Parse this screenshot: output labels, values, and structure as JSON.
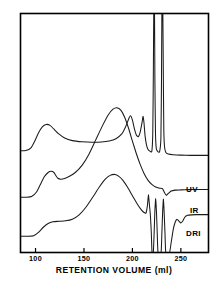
{
  "chart_data": {
    "type": "line",
    "title": "",
    "subtitle": "",
    "xlabel": "RETENTION VOLUME (ml)",
    "ylabel": "",
    "xlim": [
      85,
      278
    ],
    "ylim": [
      0,
      100
    ],
    "grid": false,
    "legend_position": "inline-right",
    "x_ticks": [
      100,
      150,
      200,
      250
    ],
    "x_tick_labels": [
      "100",
      "150",
      "200",
      "250"
    ],
    "y_ticks": [],
    "y_tick_labels": [],
    "annotations": [
      {
        "text": "UV",
        "x": 262,
        "y": 46
      },
      {
        "text": "IR",
        "x": 264,
        "y": 26
      },
      {
        "text": "DRI",
        "x": 262,
        "y": 8
      }
    ],
    "series": [
      {
        "name": "UV",
        "label": "UV",
        "color": "#1a1a1a",
        "points": [
          [
            85,
            42.5
          ],
          [
            90,
            42.6
          ],
          [
            95,
            43.6
          ],
          [
            99,
            46.4
          ],
          [
            103,
            50.0
          ],
          [
            107,
            52.6
          ],
          [
            111,
            53.6
          ],
          [
            115,
            53.2
          ],
          [
            119,
            51.6
          ],
          [
            124,
            49.6
          ],
          [
            130,
            47.9
          ],
          [
            138,
            46.8
          ],
          [
            148,
            46.3
          ],
          [
            158,
            46.1
          ],
          [
            168,
            46.2
          ],
          [
            176,
            46.6
          ],
          [
            183,
            47.6
          ],
          [
            189,
            49.6
          ],
          [
            193,
            52.6
          ],
          [
            196,
            55.8
          ],
          [
            198,
            57.2
          ],
          [
            200,
            55.4
          ],
          [
            202,
            51.8
          ],
          [
            204,
            49.2
          ],
          [
            206,
            48.4
          ],
          [
            208,
            50.4
          ],
          [
            210,
            54.6
          ],
          [
            211,
            57.0
          ],
          [
            212,
            54.0
          ],
          [
            213,
            49.0
          ],
          [
            214.5,
            45.0
          ],
          [
            216,
            43.2
          ],
          [
            218,
            42.4
          ],
          [
            220,
            42.3
          ],
          [
            221,
            50.0
          ],
          [
            221.6,
            75.0
          ],
          [
            222,
            100
          ],
          [
            222.8,
            100
          ],
          [
            223.2,
            72.0
          ],
          [
            223.8,
            50.0
          ],
          [
            224.6,
            43.6
          ],
          [
            226,
            42.3
          ],
          [
            228,
            42.1
          ],
          [
            229.4,
            48.0
          ],
          [
            230,
            72.0
          ],
          [
            230.4,
            100
          ],
          [
            231.4,
            100
          ],
          [
            231.9,
            74.0
          ],
          [
            232.4,
            51.0
          ],
          [
            233.2,
            44.0
          ],
          [
            234.5,
            41.8
          ],
          [
            237,
            41.2
          ],
          [
            242,
            40.9
          ],
          [
            250,
            40.7
          ],
          [
            260,
            40.6
          ],
          [
            270,
            40.6
          ],
          [
            278,
            40.6
          ]
        ]
      },
      {
        "name": "IR",
        "label": "IR",
        "color": "#1a1a1a",
        "points": [
          [
            85,
            23.0
          ],
          [
            91,
            23.0
          ],
          [
            96,
            23.3
          ],
          [
            101,
            25.2
          ],
          [
            105,
            28.4
          ],
          [
            109,
            31.6
          ],
          [
            113,
            33.4
          ],
          [
            116,
            33.9
          ],
          [
            119,
            33.4
          ],
          [
            121,
            32.1
          ],
          [
            123,
            31.0
          ],
          [
            126,
            30.6
          ],
          [
            130,
            30.9
          ],
          [
            135,
            31.8
          ],
          [
            141,
            33.4
          ],
          [
            148,
            36.4
          ],
          [
            155,
            41.0
          ],
          [
            162,
            47.0
          ],
          [
            169,
            53.0
          ],
          [
            175,
            57.6
          ],
          [
            180,
            60.0
          ],
          [
            184,
            60.6
          ],
          [
            188,
            59.6
          ],
          [
            192,
            56.6
          ],
          [
            196,
            52.0
          ],
          [
            200,
            46.6
          ],
          [
            204,
            41.4
          ],
          [
            208,
            36.8
          ],
          [
            212,
            33.0
          ],
          [
            216,
            30.2
          ],
          [
            220,
            28.4
          ],
          [
            224,
            27.3
          ],
          [
            228,
            26.8
          ],
          [
            231,
            26.6
          ],
          [
            233,
            25.0
          ],
          [
            235,
            23.8
          ],
          [
            237,
            24.6
          ],
          [
            240,
            25.6
          ],
          [
            244,
            26.0
          ],
          [
            250,
            26.1
          ],
          [
            258,
            26.2
          ],
          [
            266,
            26.3
          ],
          [
            273,
            26.3
          ],
          [
            278,
            26.3
          ]
        ]
      },
      {
        "name": "DRI",
        "label": "DRI",
        "color": "#1a1a1a",
        "points": [
          [
            85,
            6.6
          ],
          [
            92,
            6.6
          ],
          [
            98,
            6.8
          ],
          [
            103,
            8.2
          ],
          [
            108,
            10.4
          ],
          [
            113,
            12.0
          ],
          [
            118,
            12.7
          ],
          [
            124,
            12.9
          ],
          [
            131,
            13.1
          ],
          [
            138,
            13.8
          ],
          [
            145,
            15.6
          ],
          [
            152,
            18.8
          ],
          [
            159,
            23.0
          ],
          [
            166,
            27.4
          ],
          [
            172,
            30.6
          ],
          [
            177,
            32.2
          ],
          [
            182,
            32.6
          ],
          [
            186,
            31.8
          ],
          [
            190,
            30.2
          ],
          [
            195,
            27.2
          ],
          [
            200,
            23.6
          ],
          [
            205,
            20.2
          ],
          [
            209,
            17.8
          ],
          [
            212,
            16.6
          ],
          [
            214,
            16.4
          ],
          [
            215.5,
            19.6
          ],
          [
            216.5,
            24.0
          ],
          [
            217.5,
            20.0
          ],
          [
            218.6,
            15.0
          ],
          [
            219.5,
            8.0
          ],
          [
            220.2,
            0
          ],
          [
            221.6,
            0
          ],
          [
            222.4,
            8.0
          ],
          [
            223.2,
            17.4
          ],
          [
            224,
            22.4
          ],
          [
            224.8,
            17.0
          ],
          [
            225.6,
            8.0
          ],
          [
            226.4,
            0
          ],
          [
            229.6,
            0
          ],
          [
            230.4,
            8.0
          ],
          [
            231.2,
            17.0
          ],
          [
            232,
            22.2
          ],
          [
            232.8,
            16.0
          ],
          [
            233.6,
            8.0
          ],
          [
            234.4,
            0
          ],
          [
            238.4,
            0
          ],
          [
            240,
            4.0
          ],
          [
            242,
            9.2
          ],
          [
            244,
            12.4
          ],
          [
            246,
            13.8
          ],
          [
            248,
            13.0
          ],
          [
            250,
            12.2
          ],
          [
            252,
            13.0
          ],
          [
            254,
            14.6
          ],
          [
            257,
            15.4
          ],
          [
            261,
            15.6
          ],
          [
            266,
            15.7
          ],
          [
            272,
            15.7
          ],
          [
            278,
            15.7
          ]
        ]
      }
    ]
  },
  "axis": {
    "title": "RETENTION VOLUME (ml)",
    "tick_labels": [
      "100",
      "150",
      "200",
      "250"
    ]
  },
  "labels": {
    "uv": "UV",
    "ir": "IR",
    "dri": "DRI"
  },
  "colors": {
    "trace": "#1a1a1a",
    "frame": "#000000",
    "background": "#ffffff"
  }
}
